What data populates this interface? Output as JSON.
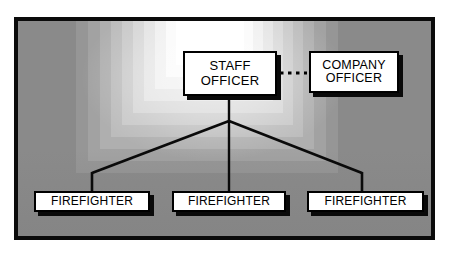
{
  "diagram": {
    "type": "org-chart",
    "background_color": "#8a8a8a",
    "frame_color": "#0b0b0b",
    "node_fill": "#ffffff",
    "node_border": "#000000",
    "shadow_color": "#0a0a0a",
    "nodes": [
      {
        "id": "staff-officer",
        "label": "STAFF\nOFFICER",
        "level": 1
      },
      {
        "id": "company-officer",
        "label": "COMPANY\nOFFICER",
        "level": 1
      },
      {
        "id": "firefighter-1",
        "label": "FIREFIGHTER",
        "level": 2
      },
      {
        "id": "firefighter-2",
        "label": "FIREFIGHTER",
        "level": 2
      },
      {
        "id": "firefighter-3",
        "label": "FIREFIGHTER",
        "level": 2
      }
    ],
    "connectors": [
      {
        "from": "staff-officer",
        "to": "company-officer",
        "style": "dotted",
        "direction": "horizontal"
      },
      {
        "from": "staff-officer",
        "to": "firefighter-1",
        "style": "solid",
        "direction": "branch-left"
      },
      {
        "from": "staff-officer",
        "to": "firefighter-2",
        "style": "solid",
        "direction": "branch-center"
      },
      {
        "from": "staff-officer",
        "to": "firefighter-3",
        "style": "solid",
        "direction": "branch-right"
      }
    ]
  }
}
